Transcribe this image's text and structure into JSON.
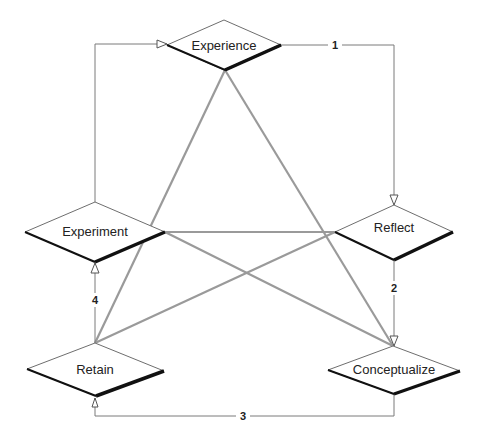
{
  "diagram": {
    "type": "cycle-flowchart",
    "colors": {
      "background": "#ffffff",
      "node_fill": "#ffffff",
      "node_outline": "#6e6e6e",
      "node_shadow": "#111111",
      "connector": "#7a7a7a",
      "cross_link": "#9a9a9a",
      "text": "#222222"
    },
    "nodes": [
      {
        "id": "experience",
        "label": "Experience",
        "shape": "diamond",
        "cx": 224,
        "cy": 45,
        "hw": 57,
        "hh": 25
      },
      {
        "id": "reflect",
        "label": "Reflect",
        "shape": "diamond",
        "cx": 394,
        "cy": 232,
        "hw": 59,
        "hh": 28
      },
      {
        "id": "conceptualize",
        "label": "Conceptualize",
        "shape": "diamond",
        "cx": 394,
        "cy": 370,
        "hw": 66,
        "hh": 24
      },
      {
        "id": "retain",
        "label": "Retain",
        "shape": "diamond",
        "cx": 95,
        "cy": 370,
        "hw": 69,
        "hh": 27
      },
      {
        "id": "experiment",
        "label": "Experiment",
        "shape": "diamond",
        "cx": 95,
        "cy": 232,
        "hw": 70,
        "hh": 30
      }
    ],
    "edges": [
      {
        "from": "experience",
        "to": "reflect",
        "label": "1"
      },
      {
        "from": "reflect",
        "to": "conceptualize",
        "label": "2"
      },
      {
        "from": "conceptualize",
        "to": "retain",
        "label": "3"
      },
      {
        "from": "retain",
        "to": "experiment",
        "label": "4"
      },
      {
        "from": "experiment",
        "to": "experience",
        "label": ""
      }
    ],
    "cross_links": [
      {
        "from": "experience",
        "to": "retain"
      },
      {
        "from": "experience",
        "to": "conceptualize"
      },
      {
        "from": "experiment",
        "to": "reflect"
      },
      {
        "from": "experiment",
        "to": "conceptualize"
      },
      {
        "from": "retain",
        "to": "reflect"
      }
    ]
  }
}
